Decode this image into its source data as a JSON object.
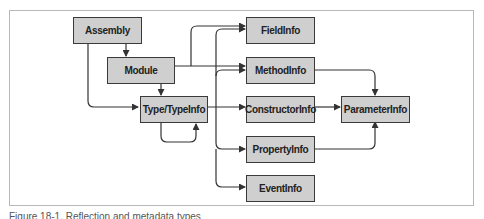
{
  "diagram": {
    "nodes": [
      {
        "id": "assembly",
        "label": "Assembly"
      },
      {
        "id": "module",
        "label": "Module"
      },
      {
        "id": "type",
        "label": "Type/TypeInfo"
      },
      {
        "id": "fieldinfo",
        "label": "FieldInfo"
      },
      {
        "id": "methodinfo",
        "label": "MethodInfo"
      },
      {
        "id": "constructorinfo",
        "label": "ConstructorInfo"
      },
      {
        "id": "propertyinfo",
        "label": "PropertyInfo"
      },
      {
        "id": "eventinfo",
        "label": "EventInfo"
      },
      {
        "id": "parameterinfo",
        "label": "ParameterInfo"
      }
    ],
    "edges": [
      {
        "from": "assembly",
        "to": "module"
      },
      {
        "from": "assembly",
        "to": "type"
      },
      {
        "from": "module",
        "to": "type"
      },
      {
        "from": "module",
        "to": "fieldinfo"
      },
      {
        "from": "module",
        "to": "methodinfo"
      },
      {
        "from": "type",
        "to": "type"
      },
      {
        "from": "type",
        "to": "fieldinfo"
      },
      {
        "from": "type",
        "to": "methodinfo"
      },
      {
        "from": "type",
        "to": "constructorinfo"
      },
      {
        "from": "type",
        "to": "propertyinfo"
      },
      {
        "from": "type",
        "to": "eventinfo"
      },
      {
        "from": "methodinfo",
        "to": "parameterinfo"
      },
      {
        "from": "constructorinfo",
        "to": "parameterinfo"
      },
      {
        "from": "propertyinfo",
        "to": "parameterinfo"
      }
    ]
  },
  "caption": "Figure 18-1. Reflection and metadata types"
}
